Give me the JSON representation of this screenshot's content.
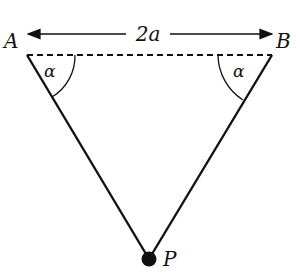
{
  "diagram": {
    "points": {
      "A": {
        "label": "A"
      },
      "B": {
        "label": "B"
      },
      "P": {
        "label": "P"
      }
    },
    "distance_label": "2a",
    "angle_left": "α",
    "angle_right": "α",
    "colors": {
      "line": "#111111",
      "background": "#ffffff"
    }
  }
}
